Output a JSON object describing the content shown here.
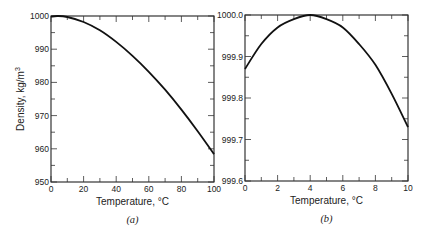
{
  "chart_data": [
    {
      "id": "a",
      "type": "line",
      "panel_label": "(a)",
      "title": "",
      "xlabel": "Temperature, °C",
      "ylabel": "Density, kg/m",
      "ylabel_sup": "3",
      "xlim": [
        0,
        100
      ],
      "ylim": [
        950,
        1000
      ],
      "xticks": [
        0,
        20,
        40,
        60,
        80,
        100
      ],
      "xtick_labels": [
        "0",
        "20",
        "40",
        "60",
        "80",
        "100"
      ],
      "yticks": [
        950,
        960,
        970,
        980,
        990,
        1000
      ],
      "ytick_labels": [
        "950",
        "960",
        "970",
        "980",
        "990",
        "1000"
      ],
      "x_minor_step": 10,
      "y_minor_step": 5,
      "grid": false,
      "series": [
        {
          "name": "Water density",
          "x": [
            0,
            4,
            10,
            20,
            30,
            40,
            50,
            60,
            70,
            80,
            90,
            100
          ],
          "y": [
            999.8,
            1000.0,
            999.7,
            998.2,
            995.7,
            992.2,
            988.0,
            983.2,
            977.8,
            971.8,
            965.3,
            958.4
          ]
        }
      ]
    },
    {
      "id": "b",
      "type": "line",
      "panel_label": "(b)",
      "title": "",
      "xlabel": "Temperature, °C",
      "ylabel": "",
      "xlim": [
        0,
        10
      ],
      "ylim": [
        999.6,
        1000.0
      ],
      "xticks": [
        0,
        2,
        4,
        6,
        8,
        10
      ],
      "xtick_labels": [
        "0",
        "2",
        "4",
        "6",
        "8",
        "10"
      ],
      "yticks": [
        999.6,
        999.7,
        999.8,
        999.9,
        1000.0
      ],
      "ytick_labels": [
        "999.6",
        "999.7",
        "999.8",
        "999.9",
        "1000.0"
      ],
      "x_minor_step": 1,
      "y_minor_step": 0.05,
      "grid": false,
      "series": [
        {
          "name": "Water density",
          "x": [
            0,
            1,
            2,
            3,
            4,
            5,
            6,
            7,
            8,
            9,
            10
          ],
          "y": [
            999.87,
            999.93,
            999.97,
            999.99,
            1000.0,
            999.99,
            999.97,
            999.93,
            999.88,
            999.81,
            999.73
          ]
        }
      ]
    }
  ]
}
